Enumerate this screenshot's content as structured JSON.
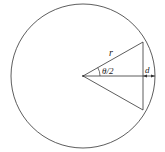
{
  "diagram": {
    "type": "geometry",
    "labels": {
      "radius": "r",
      "half_angle": "θ/2",
      "sagitta": "d"
    },
    "colors": {
      "stroke": "#333333",
      "background": "#ffffff"
    }
  }
}
